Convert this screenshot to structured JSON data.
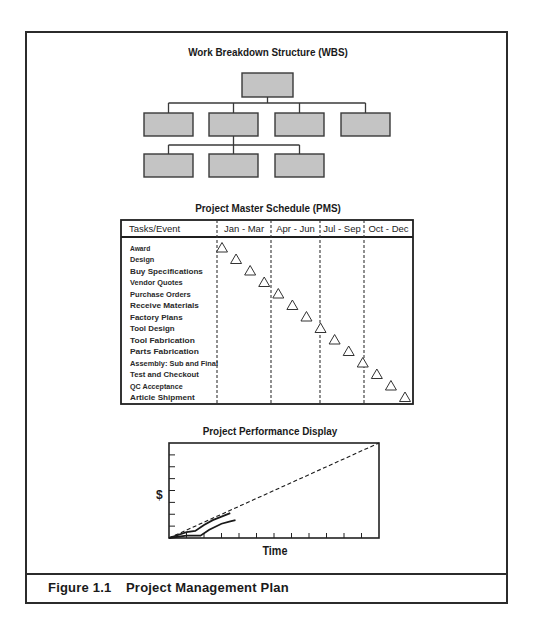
{
  "wbs": {
    "title": "Work Breakdown Structure (WBS)",
    "box_fill": "#c4c4c4",
    "box_stroke": "#3a3a3a",
    "levels": [
      {
        "y": 73,
        "h": 24,
        "boxes": [
          {
            "x": 242,
            "w": 51
          }
        ]
      },
      {
        "y": 113,
        "h": 23,
        "boxes": [
          {
            "x": 144,
            "w": 49
          },
          {
            "x": 209,
            "w": 49
          },
          {
            "x": 275,
            "w": 49
          },
          {
            "x": 341,
            "w": 49
          }
        ]
      },
      {
        "y": 154,
        "h": 23,
        "boxes": [
          {
            "x": 144,
            "w": 49
          },
          {
            "x": 209,
            "w": 49
          },
          {
            "x": 275,
            "w": 49
          }
        ]
      }
    ]
  },
  "pms": {
    "title": "Project Master Schedule (PMS)",
    "header": {
      "task_col": "Tasks/Event",
      "quarters": [
        "Jan - Mar",
        "Apr - Jun",
        "Jul - Sep",
        "Oct - Dec"
      ]
    },
    "tasks": [
      {
        "label": "Award",
        "marker": 0.03
      },
      {
        "label": "Design",
        "marker": 0.1
      },
      {
        "label": "Buy Specifications",
        "marker": 0.17
      },
      {
        "label": "Vendor Quotes",
        "marker": 0.24
      },
      {
        "label": "Purchase Orders",
        "marker": 0.31
      },
      {
        "label": "Receive Materials",
        "marker": 0.38
      },
      {
        "label": "Factory Plans",
        "marker": 0.45
      },
      {
        "label": "Tool Design",
        "marker": 0.52
      },
      {
        "label": "Tool Fabrication",
        "marker": 0.59
      },
      {
        "label": "Parts Fabrication",
        "marker": 0.66
      },
      {
        "label": "Assembly: Sub and Final",
        "marker": 0.73
      },
      {
        "label": "Test and Checkout",
        "marker": 0.8
      },
      {
        "label": "QC Acceptance",
        "marker": 0.87
      },
      {
        "label": "Article Shipment",
        "marker": 0.94
      }
    ]
  },
  "ppd": {
    "title": "Project Performance Display",
    "ylabel": "$",
    "xlabel": "Time"
  },
  "figure": {
    "number": "Figure 1.1",
    "caption": "Project Management Plan"
  },
  "chart_data": {
    "type": "line",
    "title": "Project Performance Display",
    "xlabel": "Time",
    "ylabel": "$",
    "grid": false,
    "x_ticks": 11,
    "y_ticks": 7,
    "xlim": [
      0,
      12
    ],
    "ylim": [
      0,
      8
    ],
    "series": [
      {
        "name": "Planned (baseline)",
        "style": "dashed",
        "x": [
          0,
          12
        ],
        "y": [
          0,
          8
        ]
      },
      {
        "name": "Actual cost",
        "style": "solid",
        "x": [
          0,
          1,
          1.5,
          2,
          2.5,
          3,
          3.5
        ],
        "y": [
          0,
          0.5,
          0.6,
          1.1,
          1.5,
          1.8,
          2.1
        ]
      },
      {
        "name": "Earned value",
        "style": "solid",
        "x": [
          0,
          1,
          1.8,
          2.3,
          3,
          3.5,
          3.8
        ],
        "y": [
          0,
          0.2,
          0.2,
          0.7,
          1.2,
          1.4,
          1.5
        ]
      }
    ]
  }
}
